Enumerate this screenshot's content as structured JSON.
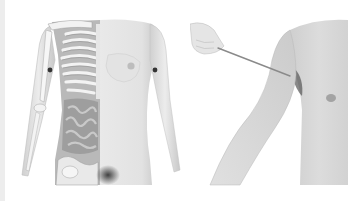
{
  "image": {
    "background": "#ffffff",
    "edge_strip_color": "#ededed",
    "panels": [
      {
        "name": "anatomy-illustration",
        "subject": "female-torso-half-skeleton-half-skin",
        "markers": 2,
        "colors": {
          "skin": "#e4e4e4",
          "skin_shadow": "#c9c9c9",
          "bone": "#f4f4f4",
          "organs": "#9a9a9a",
          "marker": "#333333"
        }
      },
      {
        "name": "arm-pointer-photo",
        "subject": "male-arm-with-pointer-probe",
        "colors": {
          "skin": "#d8d8d8",
          "skin_shadow": "#b5b5b5",
          "pointer": "#8a8a8a",
          "armpit": "#555555"
        }
      }
    ]
  }
}
